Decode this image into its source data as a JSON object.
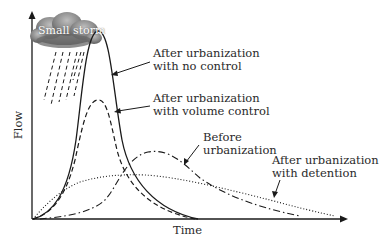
{
  "diagram": {
    "cloud_label": "Small storm",
    "x_axis_label": "Time",
    "y_axis_label": "Flow",
    "curves": [
      {
        "id": "no_control",
        "style": "solid",
        "label_line1": "After urbanization",
        "label_line2": "with no control"
      },
      {
        "id": "volume_control",
        "style": "dashed",
        "label_line1": "After urbanization",
        "label_line2": "with volume control"
      },
      {
        "id": "before",
        "style": "dash-dot",
        "label_line1": "Before",
        "label_line2": "urbanization"
      },
      {
        "id": "detention",
        "style": "dotted",
        "label_line1": "After urbanization",
        "label_line2": "with detention"
      }
    ],
    "colors": {
      "line": "#1a1a1a",
      "cloud_dark": "#6e6e6e",
      "cloud_light": "#b5b5b5",
      "text": "#2a2a2a"
    }
  }
}
